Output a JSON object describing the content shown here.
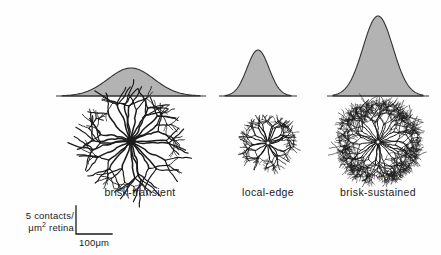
{
  "figure": {
    "background_color": "#fefefe",
    "curve_fill_color": "#b3b3b3",
    "curve_stroke_color": "#333333",
    "neuron_ink_color": "#1a1a1a",
    "text_color": "#1a1a1a"
  },
  "columns": [
    {
      "id": "brisk-transient",
      "label": "brisk-transient",
      "label_x": 140,
      "label_y": 186
    },
    {
      "id": "local-edge",
      "label": "local-edge",
      "label_x": 268,
      "label_y": 186
    },
    {
      "id": "brisk-sustained",
      "label": "brisk-sustained",
      "label_x": 378,
      "label_y": 186
    }
  ],
  "scalebar": {
    "vertical_label_line1": "5 contacts/",
    "vertical_label_line2_prefix": "μm",
    "vertical_label_line2_sup": "2",
    "vertical_label_line2_suffix": " retina",
    "horizontal_label": "100μm",
    "corner_x": 76,
    "top_y": 206,
    "bottom_y": 234,
    "right_x": 112
  },
  "chart_data": {
    "type": "area",
    "title": "",
    "subtitle": "",
    "xlabel": "",
    "ylabel": "5 contacts/μm² retina",
    "legend_position": "none",
    "grid": false,
    "axis_baseline_y": 96,
    "scale_note": "Vertical scale bar = 5 contacts/μm² retina; horizontal scale bar = 100μm",
    "categories": [
      "brisk-transient",
      "local-edge",
      "brisk-sustained"
    ],
    "series": [
      {
        "name": "dendritic contact density profile",
        "values": [
          28,
          46,
          80
        ]
      },
      {
        "name": "profile width (μm, approx full span)",
        "values": [
          138,
          65,
          90
        ]
      }
    ],
    "curves": [
      {
        "category": "brisk-transient",
        "center_x": 131,
        "peak_y": 68,
        "peak_height": 28,
        "half_width": 69,
        "sigma": 23,
        "span_x": [
          62,
          200
        ],
        "description": "broad low-amplitude gaussian"
      },
      {
        "category": "local-edge",
        "center_x": 258,
        "peak_y": 50,
        "peak_height": 46,
        "half_width": 33,
        "sigma": 11,
        "span_x": [
          225,
          291
        ],
        "description": "narrow medium-amplitude gaussian"
      },
      {
        "category": "brisk-sustained",
        "center_x": 378,
        "peak_y": 16,
        "peak_height": 80,
        "half_width": 45,
        "sigma": 15,
        "span_x": [
          333,
          423
        ],
        "description": "narrow tall-amplitude gaussian"
      }
    ],
    "neurons": [
      {
        "category": "brisk-transient",
        "center_x": 131,
        "center_y": 141,
        "radius": 45,
        "branch_count": 26,
        "density": "sparse",
        "soma_radius": 5,
        "soma_filled": true
      },
      {
        "category": "local-edge",
        "center_x": 268,
        "center_y": 143,
        "radius": 26,
        "branch_count": 22,
        "density": "medium",
        "soma_radius": 2,
        "soma_filled": false
      },
      {
        "category": "brisk-sustained",
        "center_x": 378,
        "center_y": 142,
        "radius": 40,
        "branch_count": 34,
        "density": "dense",
        "soma_radius": 2,
        "soma_filled": false
      }
    ]
  }
}
